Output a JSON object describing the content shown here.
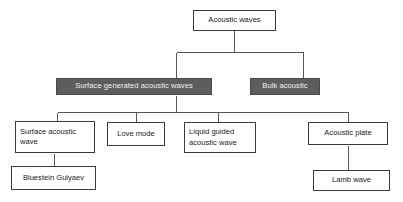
{
  "diagram": {
    "type": "tree-hierarchy",
    "colors": {
      "background": "#fefefe",
      "box_fill": "#ffffff",
      "box_border": "#3a3a3a",
      "shaded_fill": "#5d5d5d",
      "shaded_text": "#f2f2f2",
      "text": "#1a1a1a",
      "connector": "#555555"
    },
    "nodes": {
      "root": {
        "label": "Acoustic waves",
        "style": "plain"
      },
      "surface_generated": {
        "label": "Surface generated acoustic waves",
        "style": "shaded"
      },
      "bulk_acoustic": {
        "label": "Bulk acoustic",
        "style": "shaded"
      },
      "surface_acoustic_wave": {
        "label": "Surface acoustic\nwave",
        "style": "plain"
      },
      "love_mode": {
        "label": "Love mode",
        "style": "plain"
      },
      "liquid_guided": {
        "label": "Liquid guided\nacoustic wave",
        "style": "plain"
      },
      "acoustic_plate": {
        "label": "Acoustic plate",
        "style": "plain"
      },
      "bluestein_gulyaev": {
        "label": "Bluestein Gulyaev",
        "style": "plain"
      },
      "lamb_wave": {
        "label": "Lamb wave",
        "style": "plain"
      }
    },
    "edges": [
      {
        "from": "root",
        "to": "surface_generated"
      },
      {
        "from": "root",
        "to": "bulk_acoustic"
      },
      {
        "from": "surface_generated",
        "to": "surface_acoustic_wave"
      },
      {
        "from": "surface_generated",
        "to": "love_mode"
      },
      {
        "from": "surface_generated",
        "to": "liquid_guided"
      },
      {
        "from": "surface_generated",
        "to": "acoustic_plate"
      },
      {
        "from": "surface_acoustic_wave",
        "to": "bluestein_gulyaev"
      },
      {
        "from": "acoustic_plate",
        "to": "lamb_wave"
      }
    ]
  }
}
